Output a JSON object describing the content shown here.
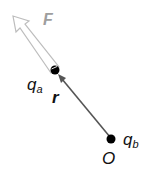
{
  "diagram": {
    "force_label": "F",
    "charge_a": {
      "symbol": "q",
      "subscript": "a"
    },
    "charge_b": {
      "symbol": "q",
      "subscript": "b"
    },
    "vector_label": "r",
    "origin_label": "O",
    "colors": {
      "force_arrow": "#bdbdbd",
      "force_label": "#9e9e9e",
      "r_arrow": "#555555",
      "dots": "#000000",
      "text": "#111111"
    }
  }
}
